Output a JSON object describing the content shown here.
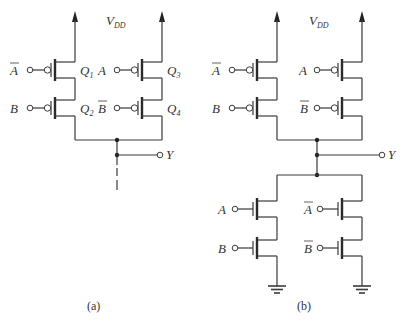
{
  "figure": {
    "panels": [
      {
        "id": "a",
        "caption": "(a)",
        "supply_label": "V",
        "supply_sub": "DD",
        "output_label": "Y",
        "transistors": [
          {
            "name": "Q",
            "sub": "1",
            "input": "A",
            "input_bar": true,
            "type": "PMOS"
          },
          {
            "name": "Q",
            "sub": "2",
            "input": "B",
            "input_bar": false,
            "type": "PMOS"
          },
          {
            "name": "Q",
            "sub": "3",
            "input": "A",
            "input_bar": false,
            "type": "PMOS"
          },
          {
            "name": "Q",
            "sub": "4",
            "input": "B",
            "input_bar": true,
            "type": "PMOS"
          }
        ]
      },
      {
        "id": "b",
        "caption": "(b)",
        "supply_label": "V",
        "supply_sub": "DD",
        "output_label": "Y",
        "pull_up_inputs": [
          {
            "input": "A",
            "input_bar": true
          },
          {
            "input": "B",
            "input_bar": false
          },
          {
            "input": "A",
            "input_bar": false
          },
          {
            "input": "B",
            "input_bar": true
          }
        ],
        "pull_down_inputs": [
          {
            "input": "A",
            "input_bar": false
          },
          {
            "input": "B",
            "input_bar": false
          },
          {
            "input": "A",
            "input_bar": true
          },
          {
            "input": "B",
            "input_bar": true
          }
        ]
      }
    ]
  }
}
